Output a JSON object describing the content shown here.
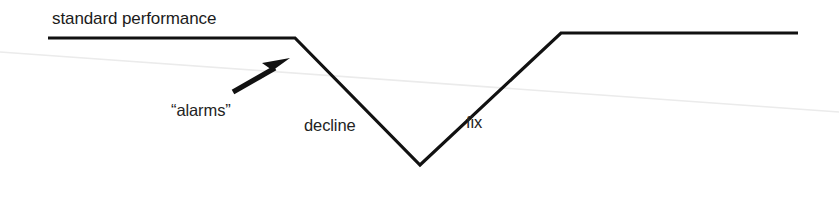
{
  "canvas": {
    "width": 839,
    "height": 200,
    "background": "#ffffff",
    "ink_color": "#111111",
    "artifact_color": "#e9e9e9"
  },
  "labels": {
    "standard_performance": "standard performance",
    "alarms": "“alarms”",
    "decline": "decline",
    "fix": "fix"
  },
  "annotations": {
    "arrow": {
      "name": "alarms-pointer-arrow",
      "from_x": 232,
      "from_y": 92,
      "to_x": 288,
      "to_y": 60,
      "direction": "up-right",
      "color": "#111111"
    }
  },
  "chart_data": {
    "type": "line",
    "xlabel": "",
    "ylabel": "performance",
    "xlim": [
      0,
      839
    ],
    "ylim": [
      200,
      0
    ],
    "grid": false,
    "legend": false,
    "stroke_color": "#111111",
    "stroke_width": 3.2,
    "series": [
      {
        "name": "performance",
        "points": [
          {
            "x": 48,
            "y": 38,
            "phase": "standard performance"
          },
          {
            "x": 295,
            "y": 38,
            "phase": "standard performance"
          },
          {
            "x": 420,
            "y": 165,
            "phase": "decline"
          },
          {
            "x": 561,
            "y": 33,
            "phase": "fix"
          },
          {
            "x": 798,
            "y": 33,
            "phase": "restored performance"
          }
        ]
      }
    ],
    "annotations": [
      {
        "text": "standard performance",
        "x": 52,
        "y": 22,
        "segment": "plateau-left"
      },
      {
        "text": "“alarms”",
        "x": 171,
        "y": 114,
        "segment": "arrow-callout"
      },
      {
        "text": "decline",
        "x": 304,
        "y": 129,
        "segment": "falling-edge"
      },
      {
        "text": "fix",
        "x": 466,
        "y": 126,
        "segment": "rising-edge"
      }
    ]
  },
  "scan_artifact": {
    "name": "scanner-streak-line",
    "from_x": 0,
    "from_y": 52,
    "to_x": 839,
    "to_y": 112,
    "color": "#ebebeb",
    "width": 1.6
  }
}
